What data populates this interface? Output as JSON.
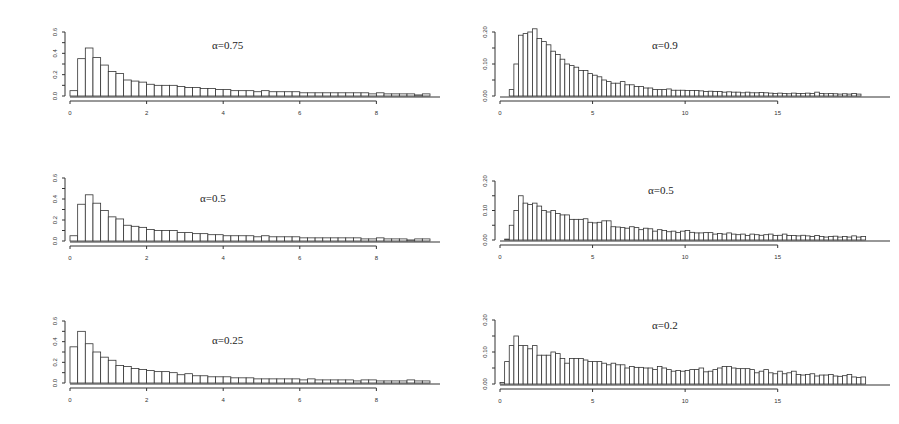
{
  "chart_data": [
    {
      "type": "bar",
      "panel": "top-left",
      "title": "α=0.75",
      "xlabel": "",
      "ylabel": "",
      "xlim": [
        0,
        9.4
      ],
      "ylim": [
        0,
        0.6
      ],
      "xticks": [
        "0",
        "2",
        "4",
        "6",
        "8"
      ],
      "xtick_values": [
        0,
        2,
        4,
        6,
        8
      ],
      "yticks": [
        "0.0",
        "0.2",
        "0.4",
        "0.6"
      ],
      "ytick_values": [
        0,
        0.2,
        0.4,
        0.6
      ],
      "bin_start": 0,
      "bin_width": 0.2,
      "values": [
        0.05,
        0.35,
        0.45,
        0.36,
        0.29,
        0.23,
        0.21,
        0.15,
        0.14,
        0.13,
        0.11,
        0.1,
        0.1,
        0.1,
        0.09,
        0.08,
        0.08,
        0.07,
        0.07,
        0.06,
        0.06,
        0.05,
        0.05,
        0.05,
        0.04,
        0.05,
        0.04,
        0.04,
        0.04,
        0.04,
        0.03,
        0.03,
        0.03,
        0.03,
        0.03,
        0.03,
        0.03,
        0.03,
        0.03,
        0.02,
        0.03,
        0.02,
        0.02,
        0.02,
        0.02,
        0.01,
        0.02
      ]
    },
    {
      "type": "bar",
      "panel": "top-right",
      "title": "α=0.9",
      "xlabel": "",
      "ylabel": "",
      "xlim": [
        0,
        19.5
      ],
      "ylim": [
        0,
        0.2
      ],
      "xticks": [
        "0",
        "5",
        "10",
        "15"
      ],
      "xtick_values": [
        0,
        5,
        10,
        15
      ],
      "yticks": [
        "0.00",
        "0.10",
        "0.20"
      ],
      "ytick_values": [
        0,
        0.1,
        0.2
      ],
      "bin_start": 0.5,
      "bin_width": 0.25,
      "values": [
        0.02,
        0.1,
        0.19,
        0.195,
        0.2,
        0.21,
        0.18,
        0.17,
        0.16,
        0.14,
        0.13,
        0.115,
        0.1,
        0.095,
        0.09,
        0.08,
        0.08,
        0.07,
        0.065,
        0.06,
        0.05,
        0.045,
        0.04,
        0.04,
        0.045,
        0.035,
        0.035,
        0.03,
        0.03,
        0.025,
        0.025,
        0.02,
        0.02,
        0.02,
        0.022,
        0.018,
        0.018,
        0.018,
        0.017,
        0.017,
        0.017,
        0.016,
        0.014,
        0.015,
        0.014,
        0.014,
        0.012,
        0.013,
        0.012,
        0.012,
        0.01,
        0.012,
        0.01,
        0.01,
        0.011,
        0.01,
        0.009,
        0.008,
        0.009,
        0.008,
        0.007,
        0.009,
        0.008,
        0.008,
        0.009,
        0.008,
        0.012,
        0.008,
        0.007,
        0.008,
        0.007,
        0.006,
        0.007,
        0.006,
        0.008,
        0.006
      ]
    },
    {
      "type": "bar",
      "panel": "middle-left",
      "title": "α=0.5",
      "xlabel": "",
      "ylabel": "",
      "xlim": [
        0,
        9.4
      ],
      "ylim": [
        0,
        0.6
      ],
      "xticks": [
        "0",
        "2",
        "4",
        "6",
        "8"
      ],
      "xtick_values": [
        0,
        2,
        4,
        6,
        8
      ],
      "yticks": [
        "0.0",
        "0.2",
        "0.4",
        "0.6"
      ],
      "ytick_values": [
        0,
        0.2,
        0.4,
        0.6
      ],
      "bin_start": 0,
      "bin_width": 0.2,
      "values": [
        0.05,
        0.35,
        0.44,
        0.36,
        0.29,
        0.23,
        0.21,
        0.15,
        0.14,
        0.13,
        0.11,
        0.1,
        0.1,
        0.1,
        0.08,
        0.08,
        0.07,
        0.07,
        0.06,
        0.06,
        0.05,
        0.05,
        0.05,
        0.05,
        0.04,
        0.05,
        0.04,
        0.04,
        0.04,
        0.04,
        0.03,
        0.03,
        0.03,
        0.03,
        0.03,
        0.03,
        0.03,
        0.03,
        0.02,
        0.02,
        0.03,
        0.02,
        0.02,
        0.02,
        0.01,
        0.02,
        0.02
      ]
    },
    {
      "type": "bar",
      "panel": "middle-right",
      "title": "α=0.5",
      "xlabel": "",
      "ylabel": "",
      "xlim": [
        0,
        19.5
      ],
      "ylim": [
        0,
        0.2
      ],
      "xticks": [
        "0",
        "5",
        "10",
        "15"
      ],
      "xtick_values": [
        0,
        5,
        10,
        15
      ],
      "yticks": [
        "0.00",
        "0.10",
        "0.20"
      ],
      "ytick_values": [
        0,
        0.1,
        0.2
      ],
      "bin_start": 0.25,
      "bin_width": 0.25,
      "values": [
        0.003,
        0.05,
        0.1,
        0.15,
        0.125,
        0.12,
        0.125,
        0.115,
        0.1,
        0.095,
        0.1,
        0.09,
        0.085,
        0.085,
        0.07,
        0.07,
        0.07,
        0.072,
        0.06,
        0.058,
        0.06,
        0.065,
        0.065,
        0.045,
        0.044,
        0.042,
        0.04,
        0.045,
        0.042,
        0.035,
        0.04,
        0.038,
        0.03,
        0.035,
        0.032,
        0.028,
        0.03,
        0.025,
        0.03,
        0.032,
        0.026,
        0.024,
        0.024,
        0.025,
        0.025,
        0.02,
        0.022,
        0.02,
        0.024,
        0.02,
        0.018,
        0.02,
        0.015,
        0.02,
        0.018,
        0.016,
        0.018,
        0.02,
        0.015,
        0.016,
        0.02,
        0.015,
        0.015,
        0.014,
        0.016,
        0.014,
        0.012,
        0.015,
        0.012,
        0.01,
        0.012,
        0.013,
        0.01,
        0.012,
        0.01,
        0.014,
        0.01,
        0.012,
        0.014,
        0.015,
        0.016,
        0.01,
        0.012,
        0.014,
        0.016,
        0.012,
        0.01,
        0.014,
        0.015,
        0.018
      ]
    },
    {
      "type": "bar",
      "panel": "bottom-left",
      "title": "α=0.25",
      "xlabel": "",
      "ylabel": "",
      "xlim": [
        0,
        9.4
      ],
      "ylim": [
        0,
        0.6
      ],
      "xticks": [
        "0",
        "2",
        "4",
        "6",
        "8"
      ],
      "xtick_values": [
        0,
        2,
        4,
        6,
        8
      ],
      "yticks": [
        "0.0",
        "0.2",
        "0.4",
        "0.6"
      ],
      "ytick_values": [
        0,
        0.2,
        0.4,
        0.6
      ],
      "bin_start": 0,
      "bin_width": 0.2,
      "values": [
        0.35,
        0.5,
        0.38,
        0.3,
        0.25,
        0.22,
        0.17,
        0.16,
        0.14,
        0.13,
        0.12,
        0.11,
        0.11,
        0.1,
        0.08,
        0.09,
        0.07,
        0.07,
        0.06,
        0.06,
        0.06,
        0.05,
        0.05,
        0.05,
        0.04,
        0.04,
        0.04,
        0.04,
        0.04,
        0.04,
        0.03,
        0.04,
        0.03,
        0.03,
        0.03,
        0.03,
        0.03,
        0.02,
        0.03,
        0.03,
        0.02,
        0.02,
        0.02,
        0.02,
        0.03,
        0.02,
        0.02
      ]
    },
    {
      "type": "bar",
      "panel": "bottom-right",
      "title": "α=0.2",
      "xlabel": "",
      "ylabel": "",
      "xlim": [
        0,
        19.5
      ],
      "ylim": [
        0,
        0.2
      ],
      "xticks": [
        "0",
        "5",
        "10",
        "15"
      ],
      "xtick_values": [
        0,
        5,
        10,
        15
      ],
      "yticks": [
        "0.00",
        "0.10",
        "0.20"
      ],
      "ytick_values": [
        0,
        0.1,
        0.2
      ],
      "bin_start": 0,
      "bin_width": 0.25,
      "values": [
        0.005,
        0.07,
        0.12,
        0.15,
        0.12,
        0.12,
        0.11,
        0.12,
        0.09,
        0.09,
        0.09,
        0.1,
        0.095,
        0.08,
        0.065,
        0.08,
        0.08,
        0.08,
        0.075,
        0.07,
        0.07,
        0.07,
        0.065,
        0.06,
        0.065,
        0.06,
        0.06,
        0.05,
        0.055,
        0.052,
        0.052,
        0.05,
        0.05,
        0.045,
        0.055,
        0.05,
        0.045,
        0.04,
        0.042,
        0.04,
        0.042,
        0.045,
        0.045,
        0.05,
        0.038,
        0.04,
        0.045,
        0.05,
        0.055,
        0.055,
        0.05,
        0.048,
        0.048,
        0.048,
        0.045,
        0.035,
        0.04,
        0.045,
        0.035,
        0.032,
        0.04,
        0.032,
        0.035,
        0.04,
        0.03,
        0.028,
        0.03,
        0.032,
        0.025,
        0.028,
        0.028,
        0.03,
        0.025,
        0.024,
        0.026,
        0.03,
        0.022,
        0.02,
        0.022,
        0.02,
        0.018,
        0.02,
        0.02,
        0.018,
        0.016,
        0.02,
        0.015,
        0.018,
        0.02,
        0.016,
        0.015,
        0.016,
        0.016,
        0.014,
        0.015,
        0.018,
        0.015,
        0.016,
        0.015,
        0.014,
        0.016,
        0.015,
        0.013
      ]
    }
  ],
  "panels_layout": [
    {
      "x": 30,
      "y": 22,
      "w": 410,
      "h": 100,
      "plot": {
        "left": 40,
        "right": 400,
        "top": 10,
        "bottom": 74
      },
      "title_pos": [
        182,
        27
      ]
    },
    {
      "x": 470,
      "y": 22,
      "w": 420,
      "h": 100,
      "plot": {
        "left": 30,
        "right": 391,
        "top": 10,
        "bottom": 74
      },
      "title_pos": [
        182,
        27
      ]
    },
    {
      "x": 30,
      "y": 168,
      "w": 410,
      "h": 100,
      "plot": {
        "left": 40,
        "right": 400,
        "top": 10,
        "bottom": 73
      },
      "title_pos": [
        170,
        34
      ]
    },
    {
      "x": 470,
      "y": 168,
      "w": 420,
      "h": 100,
      "plot": {
        "left": 30,
        "right": 391,
        "top": 13,
        "bottom": 72
      },
      "title_pos": [
        178,
        26
      ]
    },
    {
      "x": 30,
      "y": 308,
      "w": 410,
      "h": 100,
      "plot": {
        "left": 40,
        "right": 400,
        "top": 13,
        "bottom": 75
      },
      "title_pos": [
        182,
        36
      ]
    },
    {
      "x": 470,
      "y": 305,
      "w": 420,
      "h": 100,
      "plot": {
        "left": 30,
        "right": 391,
        "top": 15,
        "bottom": 79
      },
      "title_pos": [
        182,
        24
      ]
    }
  ]
}
